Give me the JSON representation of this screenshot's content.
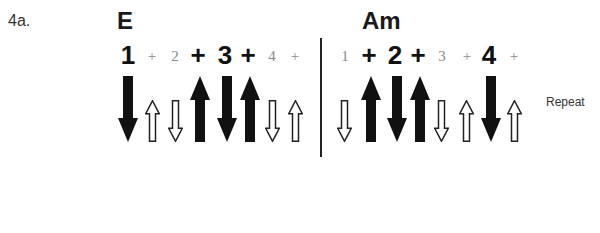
{
  "exercise_label": "4a.",
  "measures": [
    {
      "chord": "E",
      "chord_x": 117,
      "beats": [
        {
          "text": "1",
          "emphasis": "strong",
          "x": 116
        },
        {
          "text": "+",
          "emphasis": "weak",
          "x": 140
        },
        {
          "text": "2",
          "emphasis": "weak",
          "x": 163
        },
        {
          "text": "+",
          "emphasis": "strong",
          "x": 186
        },
        {
          "text": "3",
          "emphasis": "strong",
          "x": 213
        },
        {
          "text": "+",
          "emphasis": "strong",
          "x": 236
        },
        {
          "text": "4",
          "emphasis": "weak",
          "x": 260
        },
        {
          "text": "+",
          "emphasis": "weak",
          "x": 283
        }
      ],
      "strums": [
        {
          "direction": "down",
          "style": "solid",
          "x": 118
        },
        {
          "direction": "up",
          "style": "hollow",
          "x": 145
        },
        {
          "direction": "down",
          "style": "hollow",
          "x": 168
        },
        {
          "direction": "up",
          "style": "solid",
          "x": 190
        },
        {
          "direction": "down",
          "style": "solid",
          "x": 217
        },
        {
          "direction": "up",
          "style": "solid",
          "x": 240
        },
        {
          "direction": "down",
          "style": "hollow",
          "x": 265
        },
        {
          "direction": "up",
          "style": "hollow",
          "x": 288
        }
      ]
    },
    {
      "chord": "Am",
      "chord_x": 362,
      "beats": [
        {
          "text": "1",
          "emphasis": "weak",
          "x": 333
        },
        {
          "text": "+",
          "emphasis": "strong",
          "x": 357
        },
        {
          "text": "2",
          "emphasis": "strong",
          "x": 383
        },
        {
          "text": "+",
          "emphasis": "strong",
          "x": 406
        },
        {
          "text": "3",
          "emphasis": "weak",
          "x": 430
        },
        {
          "text": "+",
          "emphasis": "weak",
          "x": 455
        },
        {
          "text": "4",
          "emphasis": "strong",
          "x": 477
        },
        {
          "text": "+",
          "emphasis": "weak",
          "x": 502
        }
      ],
      "strums": [
        {
          "direction": "down",
          "style": "hollow",
          "x": 337
        },
        {
          "direction": "up",
          "style": "solid",
          "x": 361
        },
        {
          "direction": "down",
          "style": "solid",
          "x": 387
        },
        {
          "direction": "up",
          "style": "solid",
          "x": 410
        },
        {
          "direction": "down",
          "style": "hollow",
          "x": 434
        },
        {
          "direction": "up",
          "style": "hollow",
          "x": 459
        },
        {
          "direction": "down",
          "style": "solid",
          "x": 481
        },
        {
          "direction": "up",
          "style": "hollow",
          "x": 507
        }
      ]
    }
  ],
  "repeat_label": "Repeat",
  "colors": {
    "solid_arrow": "#111111",
    "hollow_arrow_stroke": "#222222",
    "strong_text": "#111111",
    "weak_text": "#888888"
  }
}
